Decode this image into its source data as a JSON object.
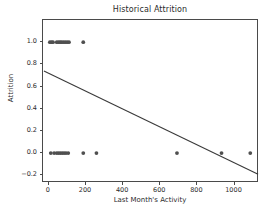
{
  "chart_data": {
    "type": "scatter",
    "title": "Historical Attrition",
    "xlabel": "Last Month's Activity",
    "ylabel": "Attrition",
    "xlim": [
      -32,
      1132
    ],
    "ylim": [
      -0.27,
      1.2
    ],
    "xticks": [
      0,
      200,
      400,
      600,
      800,
      1000
    ],
    "xtick_labels": [
      "0",
      "200",
      "400",
      "600",
      "800",
      "1000"
    ],
    "yticks": [
      -0.2,
      0.0,
      0.2,
      0.4,
      0.6,
      0.8,
      1.0
    ],
    "ytick_labels": [
      "−0.2",
      "0.0",
      "0.2",
      "0.4",
      "0.6",
      "0.8",
      "1.0"
    ],
    "grid": false,
    "legend": null,
    "marker_color": "#4f4f4f",
    "line_color": "#3a3a3a",
    "frame_color": "#4a4a4a",
    "background_color": "#ffffff",
    "points": [
      {
        "x": 5,
        "y": 1.0
      },
      {
        "x": 14,
        "y": 1.0
      },
      {
        "x": 22,
        "y": 1.0
      },
      {
        "x": 42,
        "y": 1.0
      },
      {
        "x": 52,
        "y": 1.0
      },
      {
        "x": 60,
        "y": 1.0
      },
      {
        "x": 68,
        "y": 1.0
      },
      {
        "x": 78,
        "y": 1.0
      },
      {
        "x": 88,
        "y": 1.0
      },
      {
        "x": 98,
        "y": 1.0
      },
      {
        "x": 108,
        "y": 1.0
      },
      {
        "x": 185,
        "y": 1.0
      },
      {
        "x": 10,
        "y": 0.0
      },
      {
        "x": 28,
        "y": 0.0
      },
      {
        "x": 42,
        "y": 0.0
      },
      {
        "x": 52,
        "y": 0.0
      },
      {
        "x": 62,
        "y": 0.0
      },
      {
        "x": 72,
        "y": 0.0
      },
      {
        "x": 82,
        "y": 0.0
      },
      {
        "x": 92,
        "y": 0.0
      },
      {
        "x": 104,
        "y": 0.0
      },
      {
        "x": 185,
        "y": 0.0
      },
      {
        "x": 256,
        "y": 0.0
      },
      {
        "x": 690,
        "y": 0.0
      },
      {
        "x": 930,
        "y": 0.0
      },
      {
        "x": 1085,
        "y": 0.0
      }
    ],
    "trendline": {
      "name": "linear fit",
      "x_start": -27,
      "y_start": 0.74,
      "x_end": 1127,
      "y_end": -0.19,
      "slope": -0.000806,
      "intercept": 0.7182
    }
  }
}
